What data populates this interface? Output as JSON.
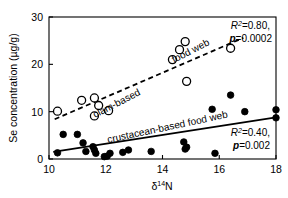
{
  "figure": {
    "background": "#ffffff",
    "foreground": "#000000"
  },
  "axes": {
    "x_title": "δ",
    "x_title_sup": "14",
    "x_title_tail": "N",
    "y_title": "Se concentration (µg/g)",
    "x_ticks": [
      "10",
      "12",
      "14",
      "16",
      "18"
    ],
    "y_ticks": [
      "0",
      "10",
      "20",
      "30"
    ]
  },
  "labels": {
    "clam_line_1": "clam-based",
    "clam_line_2": "food web",
    "crustacean": "crustacean-based food web"
  },
  "stats": {
    "clam_r2_label": "R",
    "clam_r2_sup": "2",
    "clam_r2_value": "=0.80,",
    "clam_p_label": "p",
    "clam_p_value": "=0.0002",
    "crust_r2_label": "R",
    "crust_r2_sup": "2",
    "crust_r2_value": "=0.40,",
    "crust_p_label": "p",
    "crust_p_value": "=0.002"
  },
  "chart_data": {
    "type": "scatter",
    "title": "",
    "xlabel": "δ14N",
    "ylabel": "Se concentration (µg/g)",
    "xlim": [
      10,
      18
    ],
    "ylim": [
      0,
      30
    ],
    "xticks": [
      10,
      12,
      14,
      16,
      18
    ],
    "yticks": [
      0,
      10,
      20,
      30
    ],
    "grid": false,
    "legend_position": "inline-annotations",
    "series": [
      {
        "name": "clam-based food web",
        "marker": "open-circle",
        "color": "#000000",
        "points": [
          [
            10.3,
            10.1
          ],
          [
            11.15,
            12.4
          ],
          [
            11.6,
            12.9
          ],
          [
            11.6,
            9.1
          ],
          [
            11.75,
            11.3
          ],
          [
            12.1,
            10.2
          ],
          [
            14.35,
            21.0
          ],
          [
            14.6,
            23.1
          ],
          [
            14.8,
            24.8
          ],
          [
            14.85,
            16.4
          ],
          [
            16.4,
            23.4
          ]
        ],
        "fit": {
          "type": "linear-dashed",
          "x_start": 10.2,
          "y_start": 8.4,
          "x_end": 16.85,
          "y_end": 25.6,
          "r2": 0.8,
          "p": 0.0002
        }
      },
      {
        "name": "crustacean-based food web",
        "marker": "filled-circle",
        "color": "#000000",
        "points": [
          [
            10.3,
            1.3
          ],
          [
            10.5,
            5.2
          ],
          [
            11.0,
            5.2
          ],
          [
            11.2,
            3.4
          ],
          [
            11.3,
            1.6
          ],
          [
            11.55,
            2.6
          ],
          [
            11.6,
            1.9
          ],
          [
            11.65,
            1.2
          ],
          [
            11.95,
            0.5
          ],
          [
            12.05,
            0.6
          ],
          [
            12.15,
            1.2
          ],
          [
            12.6,
            1.4
          ],
          [
            12.8,
            1.9
          ],
          [
            13.6,
            1.6
          ],
          [
            14.75,
            3.6
          ],
          [
            14.8,
            2.1
          ],
          [
            14.85,
            2.5
          ],
          [
            15.75,
            10.5
          ],
          [
            15.85,
            1.2
          ],
          [
            16.4,
            13.5
          ],
          [
            16.9,
            10.0
          ],
          [
            18.0,
            10.4
          ],
          [
            18.0,
            8.7
          ]
        ],
        "fit": {
          "type": "linear-solid",
          "x_start": 10.15,
          "y_start": 1.5,
          "x_end": 18.0,
          "y_end": 8.8,
          "r2": 0.4,
          "p": 0.002
        }
      }
    ]
  }
}
